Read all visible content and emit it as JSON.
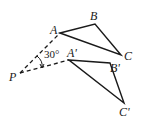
{
  "diagram": {
    "type": "geometry-rotation",
    "colors": {
      "stroke": "#1a1a1a",
      "background": "#ffffff"
    },
    "points": {
      "P": {
        "label": "P",
        "x": 20,
        "y": 73
      },
      "A": {
        "label": "A",
        "x": 60,
        "y": 33
      },
      "B": {
        "label": "B",
        "x": 95,
        "y": 24
      },
      "C": {
        "label": "C",
        "x": 121,
        "y": 55
      },
      "A1": {
        "label": "A'",
        "x": 69,
        "y": 60
      },
      "B1": {
        "label": "B'",
        "x": 110,
        "y": 63
      },
      "C1": {
        "label": "C'",
        "x": 124,
        "y": 103
      }
    },
    "angle_label": "30°"
  }
}
